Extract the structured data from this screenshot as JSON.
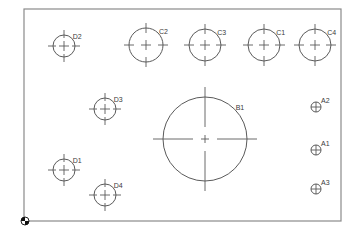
{
  "drawing": {
    "frame": {
      "x": 24,
      "y": 9,
      "width": 317,
      "height": 212
    },
    "colors": {
      "line": "#5a5a5a",
      "frame": "#8a8a8a",
      "text": "#3a3a3a",
      "background": "#ffffff"
    },
    "origin_marker": {
      "x": 25,
      "y": 221,
      "icon": "origin-datum-icon"
    },
    "holes": [
      {
        "id": "D2",
        "label": "D2",
        "cx": 64,
        "cy": 46,
        "r": 11,
        "type": "medium"
      },
      {
        "id": "C2",
        "label": "C2",
        "cx": 146,
        "cy": 45,
        "r": 17,
        "type": "large"
      },
      {
        "id": "C3",
        "label": "C3",
        "cx": 205,
        "cy": 45,
        "r": 16,
        "type": "large"
      },
      {
        "id": "C1",
        "label": "C1",
        "cx": 264,
        "cy": 45,
        "r": 16,
        "type": "large"
      },
      {
        "id": "C4",
        "label": "C4",
        "cx": 315,
        "cy": 45,
        "r": 16,
        "type": "large"
      },
      {
        "id": "D3",
        "label": "D3",
        "cx": 105,
        "cy": 109,
        "r": 11,
        "type": "medium"
      },
      {
        "id": "B1",
        "label": "B1",
        "cx": 205,
        "cy": 139,
        "r": 42,
        "type": "xlarge"
      },
      {
        "id": "A2",
        "label": "A2",
        "cx": 316,
        "cy": 107,
        "r": 5,
        "type": "small"
      },
      {
        "id": "A1",
        "label": "A1",
        "cx": 316,
        "cy": 150,
        "r": 5,
        "type": "small"
      },
      {
        "id": "A3",
        "label": "A3",
        "cx": 316,
        "cy": 189,
        "r": 5,
        "type": "small"
      },
      {
        "id": "D1",
        "label": "D1",
        "cx": 64,
        "cy": 170,
        "r": 11,
        "type": "medium"
      },
      {
        "id": "D4",
        "label": "D4",
        "cx": 105,
        "cy": 195,
        "r": 11,
        "type": "medium"
      }
    ]
  }
}
